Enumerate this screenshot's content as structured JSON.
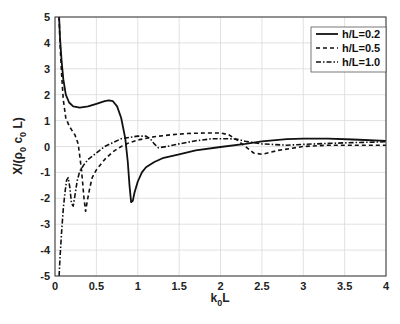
{
  "chart_data": {
    "type": "line",
    "title": "",
    "xlabel": "k0L",
    "xlabel_main": "k",
    "xlabel_sub": "0",
    "xlabel_tail": "L",
    "ylabel": "X/(ρ0 c0 L)",
    "ylabel_parts": {
      "a": "X/(ρ",
      "b": "0",
      "c": " c",
      "d": "0",
      "e": " L)"
    },
    "xlim": [
      0,
      4
    ],
    "ylim": [
      -5,
      5
    ],
    "xticks": [
      0,
      0.5,
      1,
      1.5,
      2,
      2.5,
      3,
      3.5,
      4
    ],
    "xtick_labels": [
      "0",
      "0.5",
      "1",
      "1.5",
      "2",
      "2.5",
      "3",
      "3.5",
      "4"
    ],
    "yticks": [
      -5,
      -4,
      -3,
      -2,
      -1,
      0,
      1,
      2,
      3,
      4,
      5
    ],
    "ytick_labels": [
      "-5",
      "-4",
      "-3",
      "-2",
      "-1",
      "0",
      "1",
      "2",
      "3",
      "4",
      "5"
    ],
    "grid": true,
    "legend_position": "top-right",
    "series": [
      {
        "name": "h/L=0.2",
        "style": "solid",
        "x": [
          0.05,
          0.06,
          0.08,
          0.1,
          0.13,
          0.17,
          0.22,
          0.3,
          0.4,
          0.5,
          0.6,
          0.65,
          0.7,
          0.75,
          0.8,
          0.85,
          0.88,
          0.9,
          0.92,
          0.94,
          0.96,
          1.0,
          1.05,
          1.1,
          1.2,
          1.3,
          1.5,
          1.7,
          2.0,
          2.3,
          2.5,
          2.8,
          3.0,
          3.3,
          3.6,
          4.0
        ],
        "y": [
          5.0,
          4.2,
          3.3,
          2.6,
          2.0,
          1.7,
          1.55,
          1.5,
          1.55,
          1.65,
          1.75,
          1.78,
          1.75,
          1.55,
          1.1,
          0.3,
          -0.6,
          -1.5,
          -2.15,
          -2.1,
          -1.8,
          -1.35,
          -1.0,
          -0.8,
          -0.6,
          -0.45,
          -0.3,
          -0.15,
          -0.02,
          0.1,
          0.2,
          0.28,
          0.3,
          0.3,
          0.27,
          0.22
        ]
      },
      {
        "name": "h/L=0.5",
        "style": "dashed",
        "x": [
          0.05,
          0.06,
          0.08,
          0.1,
          0.13,
          0.17,
          0.2,
          0.24,
          0.28,
          0.32,
          0.35,
          0.37,
          0.39,
          0.42,
          0.45,
          0.5,
          0.6,
          0.7,
          0.8,
          0.9,
          1.0,
          1.2,
          1.4,
          1.6,
          1.8,
          2.0,
          2.1,
          2.2,
          2.3,
          2.4,
          2.5,
          2.7,
          3.0,
          3.3,
          3.6,
          4.0
        ],
        "y": [
          5.0,
          4.0,
          2.8,
          1.8,
          1.1,
          0.8,
          0.65,
          0.45,
          0.1,
          -0.9,
          -2.0,
          -2.5,
          -2.1,
          -1.6,
          -1.2,
          -0.9,
          -0.5,
          -0.2,
          0.0,
          0.15,
          0.25,
          0.38,
          0.45,
          0.5,
          0.52,
          0.52,
          0.45,
          0.25,
          0.0,
          -0.25,
          -0.3,
          -0.15,
          0.0,
          0.05,
          0.05,
          0.05
        ]
      },
      {
        "name": "h/L=1.0",
        "style": "dashdot",
        "x": [
          0.05,
          0.06,
          0.08,
          0.1,
          0.12,
          0.14,
          0.16,
          0.18,
          0.2,
          0.22,
          0.24,
          0.27,
          0.3,
          0.35,
          0.4,
          0.5,
          0.6,
          0.7,
          0.8,
          0.9,
          1.0,
          1.1,
          1.15,
          1.2,
          1.25,
          1.35,
          1.5,
          1.7,
          1.9,
          2.1,
          2.2,
          2.3,
          2.5,
          2.8,
          3.0,
          3.3,
          3.6,
          4.0
        ],
        "y": [
          -5.0,
          -4.3,
          -3.3,
          -2.4,
          -1.8,
          -1.3,
          -1.2,
          -1.6,
          -2.2,
          -2.3,
          -1.9,
          -1.3,
          -0.95,
          -0.7,
          -0.5,
          -0.25,
          0.0,
          0.15,
          0.3,
          0.35,
          0.4,
          0.4,
          0.3,
          0.1,
          -0.05,
          0.0,
          0.1,
          0.22,
          0.3,
          0.3,
          0.28,
          0.2,
          0.1,
          0.05,
          0.08,
          0.12,
          0.15,
          0.18
        ]
      }
    ]
  }
}
